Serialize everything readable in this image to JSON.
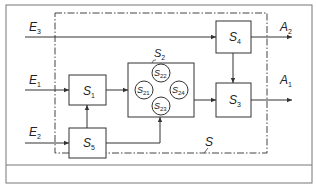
{
  "diagram": {
    "system_label": "S",
    "inputs": [
      {
        "id": "E3",
        "letter": "E",
        "sub": "3"
      },
      {
        "id": "E1",
        "letter": "E",
        "sub": "1"
      },
      {
        "id": "E2",
        "letter": "E",
        "sub": "2"
      }
    ],
    "outputs": [
      {
        "id": "A2",
        "letter": "A",
        "sub": "2"
      },
      {
        "id": "A1",
        "letter": "A",
        "sub": "1"
      }
    ],
    "blocks": [
      {
        "id": "S1",
        "letter": "S",
        "sub": "1"
      },
      {
        "id": "S5",
        "letter": "S",
        "sub": "5"
      },
      {
        "id": "S2",
        "letter": "S",
        "sub": "2"
      },
      {
        "id": "S4",
        "letter": "S",
        "sub": "4"
      },
      {
        "id": "S3",
        "letter": "S",
        "sub": "3"
      }
    ],
    "subsystems": [
      {
        "id": "S21",
        "letter": "S",
        "sub": "21"
      },
      {
        "id": "S22",
        "letter": "S",
        "sub": "22"
      },
      {
        "id": "S23",
        "letter": "S",
        "sub": "23"
      },
      {
        "id": "S24",
        "letter": "S",
        "sub": "24"
      }
    ],
    "connections": [
      [
        "E3",
        "S4"
      ],
      [
        "E1",
        "S1"
      ],
      [
        "E2",
        "S5"
      ],
      [
        "S5",
        "S1"
      ],
      [
        "S5",
        "S2"
      ],
      [
        "S1",
        "S2"
      ],
      [
        "S2",
        "S3"
      ],
      [
        "S4",
        "S3"
      ],
      [
        "S4",
        "A2"
      ],
      [
        "S3",
        "A1"
      ]
    ]
  }
}
